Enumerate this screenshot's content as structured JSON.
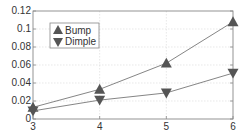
{
  "chart_data": {
    "type": "line",
    "title": "",
    "xlabel": "",
    "ylabel": "",
    "x": [
      3,
      4,
      5,
      6
    ],
    "xlim": [
      3,
      6
    ],
    "ylim": [
      0,
      0.12
    ],
    "xticks": [
      "3",
      "4",
      "5",
      "6"
    ],
    "yticks": [
      "0",
      "0.02",
      "0.04",
      "0.06",
      "0.08",
      "0.1",
      "0.12"
    ],
    "grid": true,
    "legend_position": "upper left",
    "series": [
      {
        "name": "Bump",
        "marker": "triangle-up",
        "values": [
          0.013,
          0.033,
          0.062,
          0.108
        ]
      },
      {
        "name": "Dimple",
        "marker": "triangle-down",
        "values": [
          0.009,
          0.021,
          0.029,
          0.051
        ]
      }
    ]
  },
  "colors": {
    "line": "#777777",
    "marker": "#555555",
    "axis": "#888888",
    "grid": "#d8d8d8"
  },
  "legend": {
    "items": [
      {
        "label": "Bump"
      },
      {
        "label": "Dimple"
      }
    ]
  }
}
